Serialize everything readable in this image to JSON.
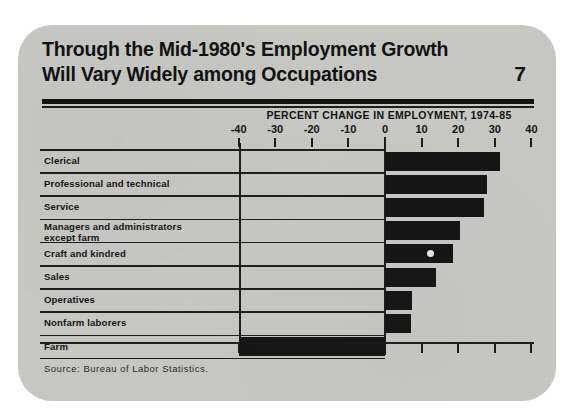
{
  "card": {
    "title_line1": "Through the Mid-1980's Employment Growth",
    "title_line2": "Will Vary Widely among Occupations",
    "page_number": "7",
    "source": "Source:  Bureau of Labor Statistics."
  },
  "chart_data": {
    "type": "bar",
    "orientation": "horizontal",
    "title": "Through the Mid-1980's Employment Growth Will Vary Widely among Occupations",
    "subtitle": "PERCENT CHANGE IN EMPLOYMENT, 1974-85",
    "xlabel": "PERCENT CHANGE IN EMPLOYMENT, 1974-85",
    "ylabel": "",
    "xlim": [
      -40,
      40
    ],
    "xticks": [
      -40,
      -30,
      -20,
      -10,
      0,
      10,
      20,
      30,
      40
    ],
    "xtick_labels": [
      "-40",
      "-30",
      "-20",
      "-10",
      "0",
      "10",
      "20",
      "30",
      "40"
    ],
    "grid": false,
    "legend": "none",
    "bar_color": "#141414",
    "categories": [
      "Clerical",
      "Professional and technical",
      "Service",
      "Managers and administrators\nexcept farm",
      "Craft and kindred",
      "Sales",
      "Operatives",
      "Nonfarm laborers",
      "Farm"
    ],
    "values": [
      31.5,
      28,
      27,
      20.5,
      18.5,
      14,
      7.5,
      7,
      -40
    ],
    "annotations": [
      {
        "name": "craft-marker",
        "category": "Craft and kindred",
        "value": 12.5
      }
    ],
    "source": "Source:  Bureau of Labor Statistics."
  }
}
